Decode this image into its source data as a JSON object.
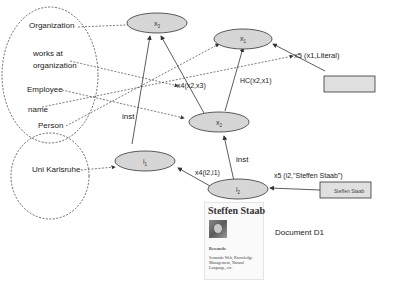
{
  "ontology_labels": {
    "organization": "Organization",
    "works_at_line1": "works at",
    "works_at_line2": "organization",
    "employee": "Employee",
    "name": "name",
    "person": "Person"
  },
  "instance_labels": {
    "uni_karlsruhe": "Uni Karlsruhe"
  },
  "nodes": {
    "x1": {
      "base": "x",
      "sub": "1"
    },
    "x2": {
      "base": "x",
      "sub": "2"
    },
    "x3": {
      "base": "x",
      "sub": "3"
    },
    "i1": {
      "base": "i",
      "sub": "1"
    },
    "i2": {
      "base": "i",
      "sub": "2"
    }
  },
  "edge_labels": {
    "x4_x2_x3": "x4(x2,x3)",
    "x5_x1_literal": "x5 (x1,Literal)",
    "hc_x2_x1": "HC(x2,x1)",
    "inst_top": "inst",
    "inst_bottom": "inst",
    "x4_i2_i1": "x4(i2,i1)",
    "x5_i2_staab": "x5 (i2,\"Steffen Staab\")"
  },
  "literal_boxes": {
    "empty": "",
    "steffen": "Steffen Staab"
  },
  "document": {
    "title": "Steffen Staab",
    "section": "Research:",
    "body": "Semantic Web, Knowledge Management, Natural Language, etc.",
    "caption": "Document D1"
  },
  "colors": {
    "node_fill": "#d6d6d6",
    "stroke": "#333333",
    "literal_fill": "#e0e0e0"
  }
}
